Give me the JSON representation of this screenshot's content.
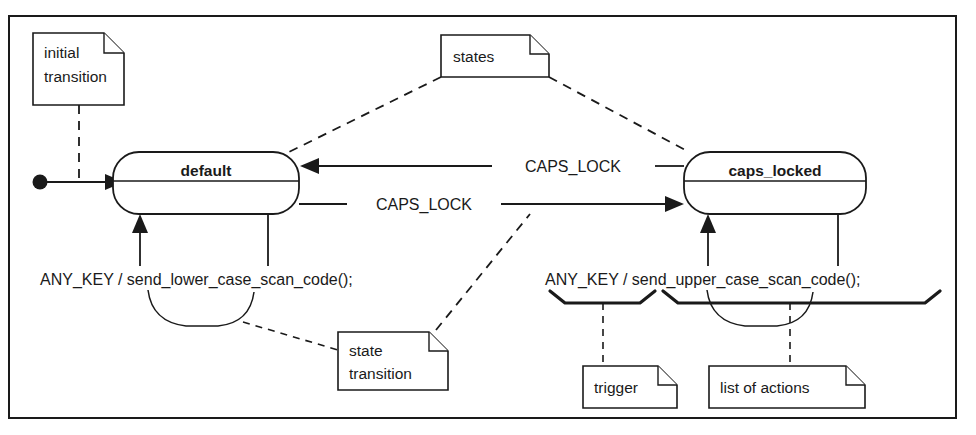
{
  "diagram": {
    "kind": "uml-state-machine-diagram",
    "frame": {
      "x": 9,
      "y": 16,
      "width": 947,
      "height": 402
    },
    "states": [
      {
        "id": "default",
        "label": "default",
        "x": 113,
        "y": 152,
        "width": 186,
        "height": 62,
        "title_divider_y": 181
      },
      {
        "id": "caps_locked",
        "label": "caps_locked",
        "x": 684,
        "y": 152,
        "width": 182,
        "height": 62,
        "title_divider_y": 181
      }
    ],
    "initial_pseudostate": {
      "cx": 40,
      "cy": 182,
      "r": 7
    },
    "transitions": [
      {
        "id": "initial",
        "label": "",
        "from": "initial-dot",
        "to": "default",
        "direction": "right"
      },
      {
        "id": "caps-to-default",
        "label": "CAPS_LOCK",
        "from": "caps_locked",
        "to": "default",
        "direction": "left",
        "label_x": 567,
        "label_y": 171
      },
      {
        "id": "default-to-caps",
        "label": "CAPS_LOCK",
        "from": "default",
        "to": "caps_locked",
        "direction": "right",
        "label_x": 422,
        "label_y": 209
      },
      {
        "id": "default-self",
        "label": "ANY_KEY / send_lower_case_scan_code();",
        "from": "default",
        "to": "default",
        "label_x": 40,
        "label_y": 279
      },
      {
        "id": "caps-self",
        "label": "ANY_KEY / send_upper_case_scan_code();",
        "from": "caps_locked",
        "to": "caps_locked",
        "label_x": 545,
        "label_y": 279
      }
    ],
    "notes": [
      {
        "id": "initial-transition",
        "lines": [
          "initial",
          "transition"
        ],
        "x": 33,
        "y": 33,
        "width": 91,
        "height": 72,
        "flap": 20,
        "anchor": "initial-transition-arrow"
      },
      {
        "id": "states",
        "lines": [
          "states"
        ],
        "x": 441,
        "y": 35,
        "width": 108,
        "height": 42,
        "flap": 19,
        "anchor": "both-state-boxes"
      },
      {
        "id": "state-transition",
        "lines": [
          "state",
          "transition"
        ],
        "x": 338,
        "y": 332,
        "width": 110,
        "height": 58,
        "flap": 19,
        "anchor": "transition-braces"
      },
      {
        "id": "trigger",
        "lines": [
          "trigger"
        ],
        "x": 583,
        "y": 366,
        "width": 94,
        "height": 42,
        "flap": 19,
        "anchor": "trigger-brace"
      },
      {
        "id": "list-of-actions",
        "lines": [
          "list of actions"
        ],
        "x": 709,
        "y": 366,
        "width": 156,
        "height": 42,
        "flap": 19,
        "anchor": "actions-brace"
      }
    ],
    "colors": {
      "ink": "#1a1a1a",
      "paper": "#ffffff"
    }
  }
}
